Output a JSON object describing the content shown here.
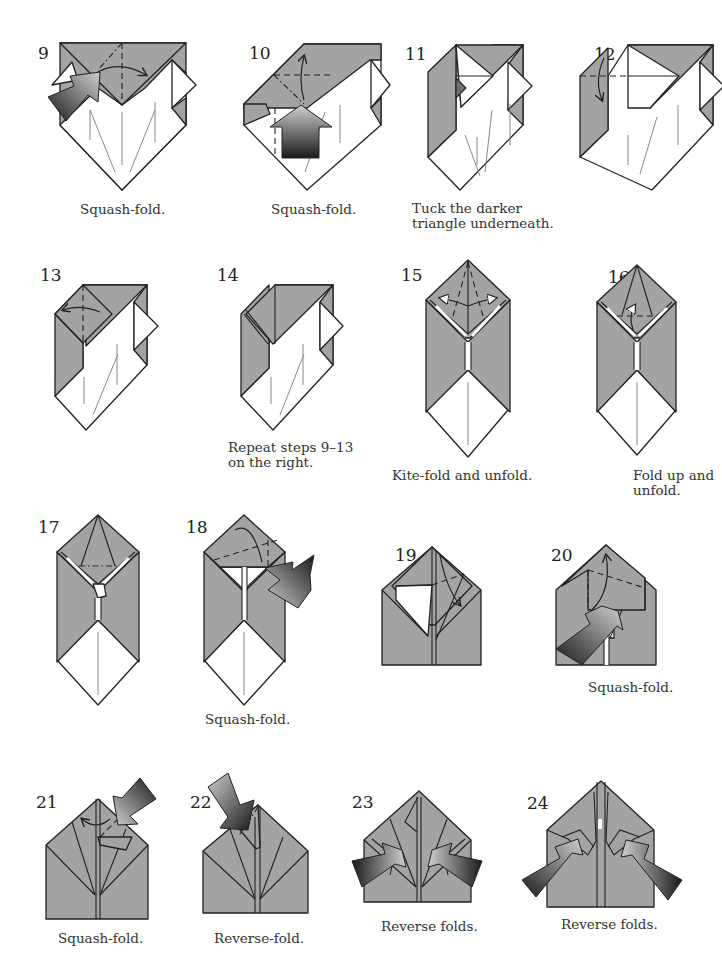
{
  "page": {
    "background": "#ffffff",
    "paper_color_colored": "#a3a3a3",
    "paper_color_white": "#ffffff",
    "dark_flap_color": "#6e6e6e",
    "arrow_gradient": [
      "#1a1a1a",
      "#c8c8c8"
    ]
  },
  "steps": [
    {
      "number": "9",
      "caption": "Squash-fold.",
      "symbols": [
        "push-arrow",
        "valley-fold-line",
        "fold-arrow"
      ]
    },
    {
      "number": "10",
      "caption": "Squash-fold.",
      "symbols": [
        "push-arrow",
        "valley-fold-line",
        "fold-arrow"
      ]
    },
    {
      "number": "11",
      "caption": "Tuck the darker\ntriangle underneath.",
      "symbols": [
        "dark-triangle"
      ]
    },
    {
      "number": "12",
      "caption": "",
      "symbols": [
        "valley-fold-line",
        "fold-arrow"
      ]
    },
    {
      "number": "13",
      "caption": "",
      "symbols": [
        "valley-fold-line",
        "fold-arrow"
      ]
    },
    {
      "number": "14",
      "caption": "Repeat steps 9–13\non the right.",
      "symbols": []
    },
    {
      "number": "15",
      "caption": "Kite-fold and unfold.",
      "symbols": [
        "valley-fold-line",
        "fold-unfold-arrow"
      ]
    },
    {
      "number": "16",
      "caption": "Fold up and\nunfold.",
      "symbols": [
        "valley-fold-line",
        "fold-unfold-arrow"
      ]
    },
    {
      "number": "17",
      "caption": "",
      "symbols": [
        "mountain-fold-line",
        "fold-arrow"
      ]
    },
    {
      "number": "18",
      "caption": "Squash-fold.",
      "symbols": [
        "push-arrow",
        "valley-fold-line",
        "fold-arrow"
      ]
    },
    {
      "number": "19",
      "caption": "",
      "symbols": [
        "valley-fold-line",
        "fold-arrow"
      ]
    },
    {
      "number": "20",
      "caption": "Squash-fold.",
      "symbols": [
        "push-arrow",
        "valley-fold-line",
        "fold-arrow"
      ]
    },
    {
      "number": "21",
      "caption": "Squash-fold.",
      "symbols": [
        "push-arrow",
        "fold-arrow"
      ]
    },
    {
      "number": "22",
      "caption": "Reverse-fold.",
      "symbols": [
        "push-arrow"
      ]
    },
    {
      "number": "23",
      "caption": "Reverse folds.",
      "symbols": [
        "push-arrow",
        "push-arrow"
      ]
    },
    {
      "number": "24",
      "caption": "Reverse folds.",
      "symbols": [
        "push-arrow",
        "push-arrow"
      ]
    }
  ]
}
